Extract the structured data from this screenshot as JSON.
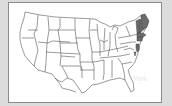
{
  "map": {
    "title": "United States",
    "highlighted_region": "New England",
    "highlighted_states": [
      "Maine",
      "New Hampshire",
      "Vermont",
      "Massachusetts",
      "Rhode Island",
      "Connecticut",
      "New Jersey",
      "Delaware"
    ],
    "highlight_color": "#6a6a6a",
    "outline_color": "#555555",
    "background_color": "#ffffff"
  },
  "ghost_text": "York"
}
